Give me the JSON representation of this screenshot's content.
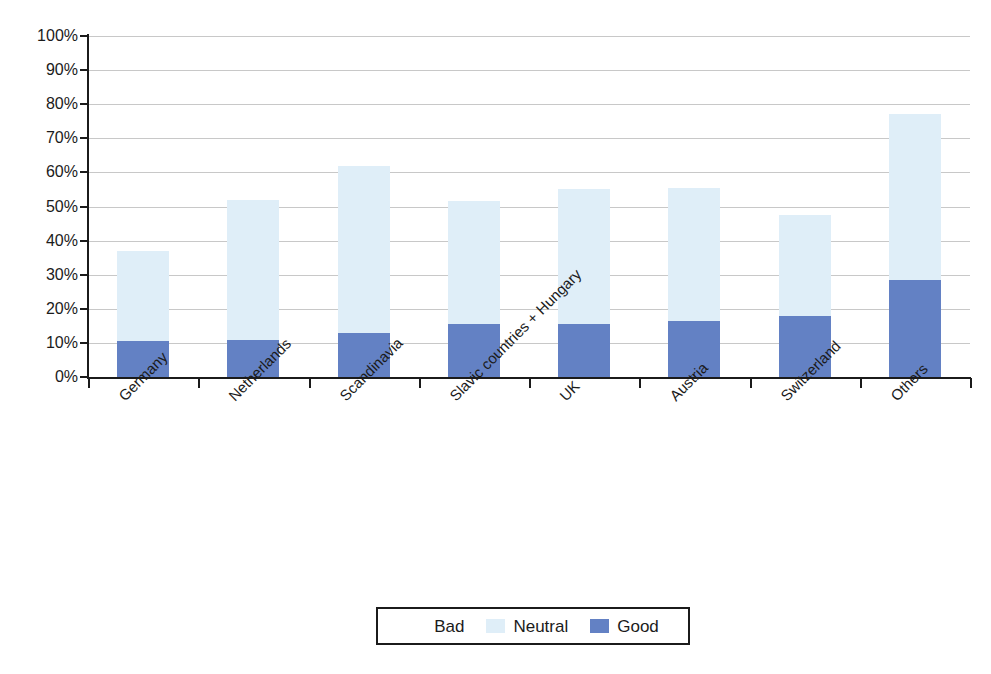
{
  "chart_data": {
    "type": "bar",
    "stacked": true,
    "title": "",
    "xlabel": "",
    "ylabel": "",
    "ylim": [
      0,
      100
    ],
    "grid": true,
    "legend_position": "bottom",
    "categories": [
      "Germany",
      "Netherlands",
      "Scandinavia",
      "Slavic countries + Hungary",
      "UK",
      "Austria",
      "Switzerland",
      "Others"
    ],
    "ytick_labels": [
      "100%",
      "90%",
      "80%",
      "70%",
      "60%",
      "50%",
      "40%",
      "30%",
      "20%",
      "10%",
      "0%"
    ],
    "ytick_values": [
      100,
      90,
      80,
      70,
      60,
      50,
      40,
      30,
      20,
      10,
      0
    ],
    "series": [
      {
        "name": "Good",
        "color": "#6381c4",
        "values": [
          10.5,
          11.0,
          13.0,
          15.5,
          15.5,
          16.5,
          18.0,
          28.5
        ]
      },
      {
        "name": "Neutral",
        "color": "#dfeef8",
        "values": [
          26.5,
          41.0,
          49.0,
          36.0,
          39.5,
          39.0,
          29.5,
          48.5
        ]
      },
      {
        "name": "Bad",
        "color": "#ffffff",
        "values": [
          63.0,
          48.0,
          38.0,
          48.5,
          45.0,
          44.5,
          52.5,
          23.0
        ]
      }
    ],
    "stack_tops": [
      37.0,
      52.0,
      62.0,
      51.5,
      55.0,
      55.5,
      47.5,
      77.0
    ]
  },
  "legend": {
    "entries": [
      {
        "label": "Bad",
        "swatch": "#ffffff"
      },
      {
        "label": "Neutral",
        "swatch": "#dfeef8"
      },
      {
        "label": "Good",
        "swatch": "#6381c4"
      }
    ]
  }
}
